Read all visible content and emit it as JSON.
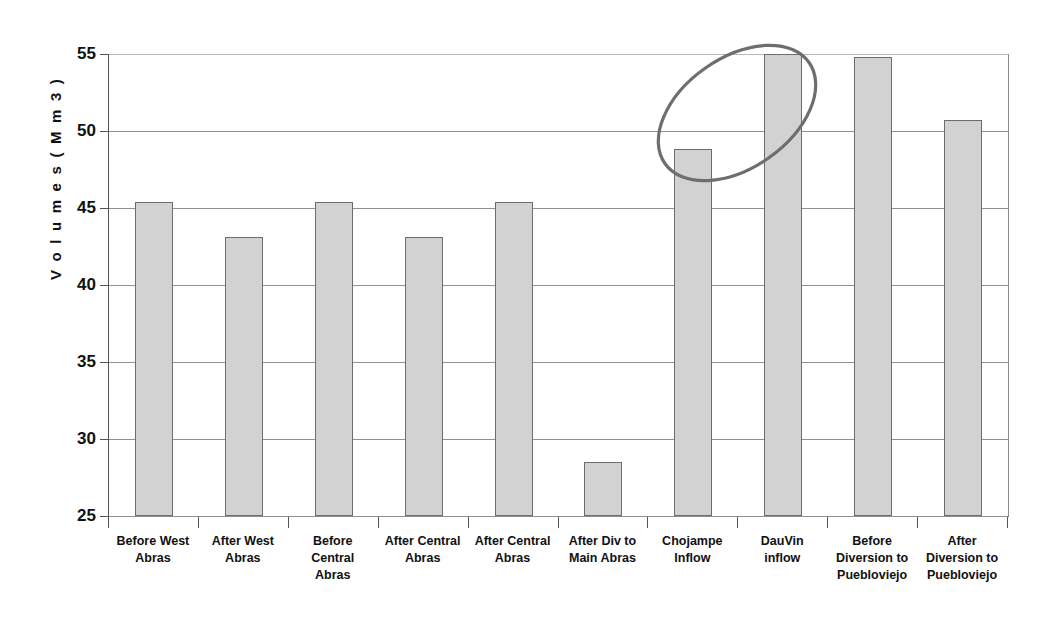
{
  "chart_data": {
    "type": "bar",
    "title": "",
    "subtitle": "",
    "xlabel": "",
    "ylabel": "V o l u m e s  ( M m 3 )",
    "ylim": [
      25,
      55
    ],
    "yticks": [
      25,
      30,
      35,
      40,
      45,
      50,
      55
    ],
    "ytick_labels": [
      "25",
      "30",
      "35",
      "40",
      "45",
      "50",
      "55"
    ],
    "grid": true,
    "legend": "none",
    "bar_fill_color": "#d2d2d2",
    "bar_border_color": "#6d6d6d",
    "categories": [
      "Before West Abras",
      "After West Abras",
      "Before Central Abras",
      "After Central Abras",
      "After Central Abras",
      "After Div to Main Abras",
      "Chojampe Inflow",
      "DauVin inflow",
      "Before Diversion to Puebloviejo",
      "After Diversion to Puebloviejo"
    ],
    "category_lines": [
      [
        "Before West",
        "Abras"
      ],
      [
        "After West",
        "Abras"
      ],
      [
        "Before",
        "Central",
        "Abras"
      ],
      [
        "After Central",
        "Abras"
      ],
      [
        "After Central",
        "Abras"
      ],
      [
        "After Div to",
        "Main Abras"
      ],
      [
        "Chojampe",
        "Inflow"
      ],
      [
        "DauVin",
        "inflow"
      ],
      [
        "Before",
        "Diversion to",
        "Puebloviejo"
      ],
      [
        "After",
        "Diversion to",
        "Puebloviejo"
      ]
    ],
    "values": [
      45.4,
      43.1,
      45.4,
      43.1,
      45.4,
      28.5,
      48.8,
      55.0,
      54.8,
      50.7
    ],
    "annotations": [
      {
        "type": "ellipse",
        "name": "highlight-ellipse",
        "color": "#6e6e6e",
        "encircles": [
          "Chojampe Inflow",
          "DauVin inflow"
        ],
        "rotation_deg": -35
      }
    ]
  },
  "y_axis": {
    "title": "V o l u m e s  ( M m 3 )",
    "ticks": [
      "55",
      "50",
      "45",
      "40",
      "35",
      "30",
      "25"
    ]
  }
}
